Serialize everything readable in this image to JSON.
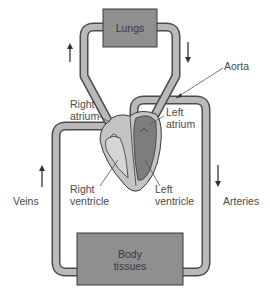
{
  "colors": {
    "background": "#ffffff",
    "pipe_fill": "#b9b9b9",
    "pipe_outline": "#4a4a4a",
    "box_fill": "#8f8f8f",
    "box_outline": "#3a3a3a",
    "heart_light": "#c4c4c4",
    "heart_dark": "#7d7d7d",
    "text": "#4a4a4a"
  },
  "boxes": {
    "lungs": {
      "label": "Lungs"
    },
    "body_tissues": {
      "label_line1": "Body",
      "label_line2": "tissues"
    }
  },
  "labels": {
    "aorta": "Aorta",
    "right_atrium_line1": "Right",
    "right_atrium_line2": "atrium",
    "left_atrium_line1": "Left",
    "left_atrium_line2": "atrium",
    "right_ventricle_line1": "Right",
    "right_ventricle_line2": "ventricle",
    "left_ventricle_line1": "Left",
    "left_ventricle_line2": "ventricle",
    "veins": "Veins",
    "arteries": "Arteries"
  },
  "arrows": {
    "pulmonary_left": "up",
    "pulmonary_right": "down",
    "veins": "up",
    "arteries": "down"
  }
}
